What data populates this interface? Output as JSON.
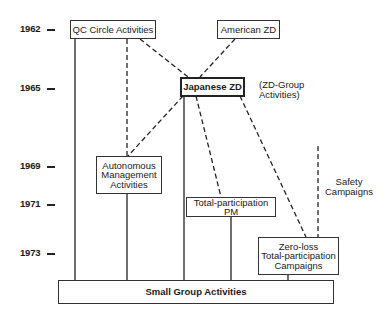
{
  "timeline": {
    "years": [
      {
        "label": "1962",
        "y": 29
      },
      {
        "label": "1965",
        "y": 88
      },
      {
        "label": "1969",
        "y": 166
      },
      {
        "label": "1971",
        "y": 204
      },
      {
        "label": "1973",
        "y": 253
      }
    ]
  },
  "nodes": {
    "qc_circle": {
      "label": "QC Circle Activities"
    },
    "american_zd": {
      "label": "American ZD"
    },
    "japanese_zd": {
      "label": "Japanese ZD",
      "note_line1": "(ZD-Group",
      "note_line2": "Activities)"
    },
    "autonomous": {
      "line1": "Autonomous",
      "line2": "Management",
      "line3": "Activities"
    },
    "total_pm": {
      "label": "Total-participation PM"
    },
    "zero_loss": {
      "line1": "Zero-loss",
      "line2": "Total-participation",
      "line3": "Campaigns"
    },
    "safety": {
      "line1": "Safety",
      "line2": "Campaigns"
    },
    "small_group": {
      "label": "Small Group Activities"
    }
  },
  "colors": {
    "line": "#222222",
    "background": "#ffffff"
  }
}
